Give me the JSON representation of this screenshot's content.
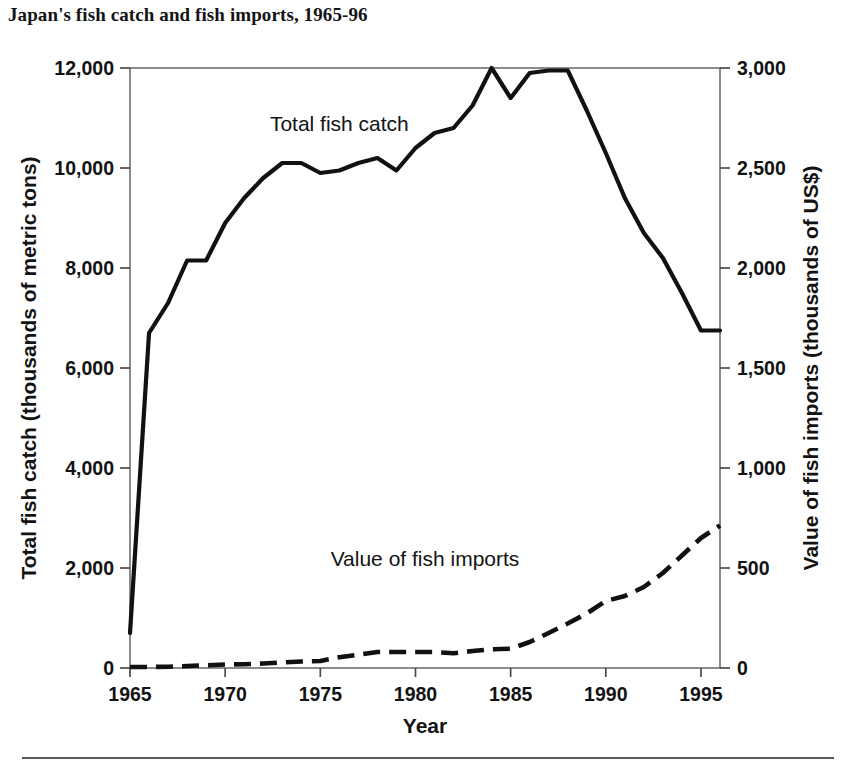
{
  "chart_data": {
    "type": "line",
    "title": "Japan's fish catch and fish imports, 1965-96",
    "xlabel": "Year",
    "ylabel": "Total fish catch (thousands of metric tons)",
    "y2label": "Value of fish imports (thousands of US$)",
    "xlim": [
      1965,
      1996
    ],
    "ylim": [
      0,
      12000
    ],
    "y2lim": [
      0,
      3000
    ],
    "grid": false,
    "legend_position": "inline-annotation",
    "x_ticks": [
      "1965",
      "1970",
      "1975",
      "1980",
      "1985",
      "1990",
      "1995"
    ],
    "x_tick_values": [
      1965,
      1970,
      1975,
      1980,
      1985,
      1990,
      1995
    ],
    "y_ticks": [
      "0",
      "2,000",
      "4,000",
      "6,000",
      "8,000",
      "10,000",
      "12,000"
    ],
    "y_tick_values": [
      0,
      2000,
      4000,
      6000,
      8000,
      10000,
      12000
    ],
    "y2_ticks": [
      "0",
      "500",
      "1,000",
      "1,500",
      "2,000",
      "2,500",
      "3,000"
    ],
    "y2_tick_values": [
      0,
      500,
      1000,
      1500,
      2000,
      2500,
      3000
    ],
    "x": [
      1965,
      1966,
      1967,
      1968,
      1969,
      1970,
      1971,
      1972,
      1973,
      1974,
      1975,
      1976,
      1977,
      1978,
      1979,
      1980,
      1981,
      1982,
      1983,
      1984,
      1985,
      1986,
      1987,
      1988,
      1989,
      1990,
      1991,
      1992,
      1993,
      1994,
      1995,
      1996
    ],
    "series": [
      {
        "name": "Total fish catch",
        "axis": "left",
        "style": "solid",
        "units": "thousands of metric tons",
        "annotation": "Total fish catch",
        "values": [
          700,
          6700,
          7300,
          8150,
          8150,
          8900,
          9400,
          9800,
          10100,
          10100,
          9900,
          9950,
          10100,
          10200,
          9950,
          10400,
          10700,
          10800,
          11250,
          12000,
          11400,
          11900,
          11950,
          11950,
          11150,
          10300,
          9400,
          8700,
          8200,
          7500,
          6750,
          6750
        ]
      },
      {
        "name": "Value of fish imports",
        "axis": "right",
        "style": "dashed",
        "units": "thousands of US$",
        "annotation": "Value of fish imports",
        "values": [
          20,
          20,
          25,
          40,
          55,
          70,
          75,
          90,
          110,
          130,
          140,
          215,
          265,
          320,
          320,
          320,
          320,
          295,
          340,
          375,
          385,
          520,
          700,
          890,
          1090,
          1340,
          1440,
          1620,
          1900,
          2250,
          2600,
          2850
        ]
      }
    ],
    "annotations": [
      {
        "text": "Total fish catch",
        "x": 1976,
        "y_left": 10750
      },
      {
        "text": "Value of fish imports",
        "x": 1980.5,
        "y_left": 2050
      }
    ]
  }
}
